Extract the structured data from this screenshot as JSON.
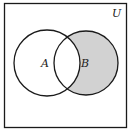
{
  "diagram": {
    "type": "venn",
    "universe_label": "U",
    "sets": [
      {
        "label": "A",
        "cx": 47,
        "cy": 63,
        "r": 33
      },
      {
        "label": "B",
        "cx": 86,
        "cy": 63,
        "r": 32
      }
    ],
    "shaded_region": "B − A",
    "colors": {
      "stroke": "#1a1a1a",
      "shade": "#d2d2d2",
      "background": "#ffffff"
    }
  }
}
